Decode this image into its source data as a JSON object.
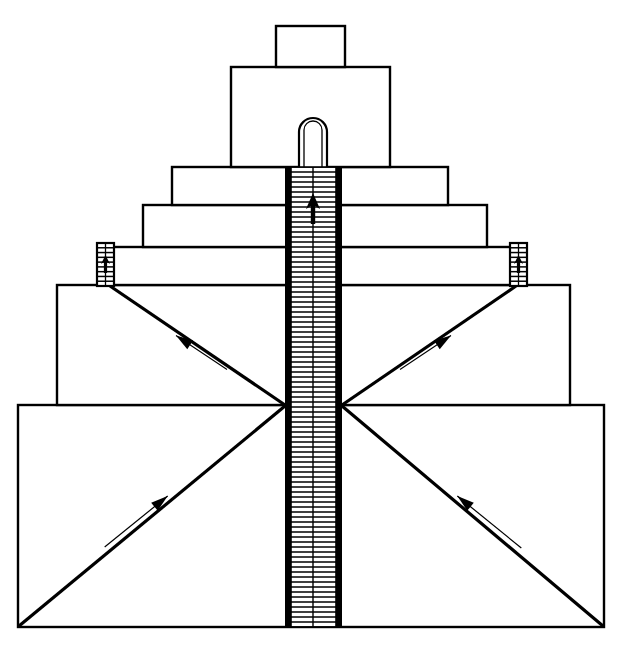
{
  "figure": {
    "title": "Stepped ziggurat elevation with central stairway and flanking ramps",
    "type": "architectural-elevation-line-drawing",
    "background_color": "#ffffff",
    "line_color": "#000000",
    "canvas": {
      "width": 623,
      "height": 647
    }
  },
  "tiers": [
    {
      "name": "summit-shrine",
      "label": "Summit shrine block",
      "x1": 276,
      "x2": 345,
      "y1": 26,
      "y2": 67,
      "width": 69,
      "height": 41
    },
    {
      "name": "tier-2",
      "label": "Second tier",
      "x1": 231,
      "x2": 390,
      "y1": 67,
      "y2": 167,
      "width": 159,
      "height": 100
    },
    {
      "name": "tier-3",
      "label": "Third tier",
      "x1": 172,
      "x2": 448,
      "y1": 167,
      "y2": 205,
      "width": 276,
      "height": 38
    },
    {
      "name": "tier-4",
      "label": "Fourth tier",
      "x1": 143,
      "x2": 487,
      "y1": 205,
      "y2": 247,
      "width": 344,
      "height": 42
    },
    {
      "name": "tier-5",
      "label": "Fifth tier with landings",
      "x1": 110,
      "x2": 515,
      "y1": 247,
      "y2": 285,
      "width": 405,
      "height": 38
    },
    {
      "name": "tier-6",
      "label": "Sixth tier with ramps",
      "x1": 57,
      "x2": 570,
      "y1": 285,
      "y2": 405,
      "width": 513,
      "height": 120
    },
    {
      "name": "tier-7-base",
      "label": "Base platform with ramps",
      "x1": 18,
      "x2": 604,
      "y1": 405,
      "y2": 627,
      "width": 586,
      "height": 222
    }
  ],
  "stairway": {
    "label": "Central stairway",
    "left_wall_x": 285,
    "right_wall_x": 342,
    "inner_left_x": 291,
    "inner_right_x": 336,
    "top_y": 167,
    "bottom_y": 627,
    "spine_x": 313,
    "step_count": 92,
    "hatch": "horizontal-step-lines",
    "direction_indicator": "up-arrow"
  },
  "arch": {
    "label": "Arched doorway at summit",
    "center_x": 313,
    "top_y": 118,
    "bottom_y": 170,
    "outer_half_width": 14,
    "inner_half_width": 9
  },
  "landings": [
    {
      "name": "landing-left",
      "label": "Left stair landing",
      "x1": 97,
      "x2": 114,
      "y1": 243,
      "y2": 286,
      "step_count": 9,
      "arrow": "up"
    },
    {
      "name": "landing-right",
      "label": "Right stair landing",
      "x1": 510,
      "x2": 527,
      "y1": 243,
      "y2": 286,
      "step_count": 9,
      "arrow": "up"
    }
  ],
  "ramps": [
    {
      "name": "ramp-upper-left",
      "label": "Upper left ascending ramp",
      "from": {
        "x": 285,
        "y": 405
      },
      "to": {
        "x": 110,
        "y": 286
      },
      "arrow_direction": "up-left",
      "arrow_tail": {
        "x": 232,
        "y": 362
      },
      "arrow_tip": {
        "x": 181,
        "y": 328
      }
    },
    {
      "name": "ramp-upper-right",
      "label": "Upper right ascending ramp",
      "from": {
        "x": 342,
        "y": 405
      },
      "to": {
        "x": 516,
        "y": 286
      },
      "arrow_direction": "up-right",
      "arrow_tail": {
        "x": 395,
        "y": 362
      },
      "arrow_tip": {
        "x": 446,
        "y": 328
      }
    },
    {
      "name": "ramp-lower-left",
      "label": "Lower left ascending ramp",
      "from": {
        "x": 19,
        "y": 626
      },
      "to": {
        "x": 285,
        "y": 406
      },
      "arrow_direction": "up-right",
      "arrow_tail": {
        "x": 99,
        "y": 540
      },
      "arrow_tip": {
        "x": 162,
        "y": 489
      }
    },
    {
      "name": "ramp-lower-right",
      "label": "Lower right ascending ramp",
      "from": {
        "x": 603,
        "y": 626
      },
      "to": {
        "x": 342,
        "y": 406
      },
      "arrow_direction": "up-left",
      "arrow_tail": {
        "x": 527,
        "y": 541
      },
      "arrow_tip": {
        "x": 463,
        "y": 489
      }
    }
  ],
  "stair_up_arrow": {
    "label": "Upward direction arrow in stairway",
    "x": 313,
    "tip_y": 193,
    "tail_y": 224
  }
}
